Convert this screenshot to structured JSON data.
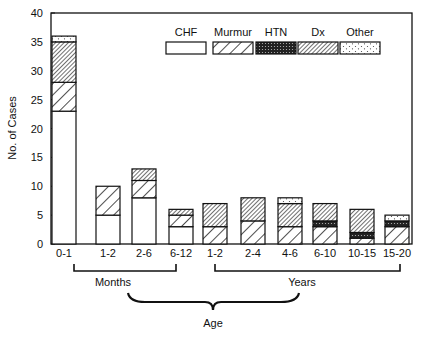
{
  "chart_data": {
    "type": "bar",
    "stacked": true,
    "title": "",
    "xlabel": "Age",
    "ylabel": "No. of Cases",
    "ylim": [
      0,
      40
    ],
    "yticks": [
      0,
      5,
      10,
      15,
      20,
      25,
      30,
      35,
      40
    ],
    "grid": false,
    "legend_position": "top-right inside",
    "categories": [
      "0-1",
      "1-2",
      "2-6",
      "6-12",
      "1-2",
      "2-4",
      "4-6",
      "6-10",
      "10-15",
      "15-20"
    ],
    "category_groups": [
      {
        "label": "Months",
        "from": 0,
        "to": 3
      },
      {
        "label": "Years",
        "from": 4,
        "to": 9
      }
    ],
    "series": [
      {
        "name": "CHF",
        "pattern": "open",
        "values": [
          23,
          5,
          8,
          3,
          0,
          0,
          0,
          0,
          0,
          0
        ]
      },
      {
        "name": "Murmur",
        "pattern": "wide-hatch",
        "values": [
          5,
          5,
          3,
          2,
          3,
          4,
          3,
          3,
          1,
          3
        ]
      },
      {
        "name": "HTN",
        "pattern": "dense-dots",
        "values": [
          0,
          0,
          0,
          0,
          0,
          0,
          0,
          1,
          1,
          1
        ]
      },
      {
        "name": "Dx",
        "pattern": "dense-hatch",
        "values": [
          7,
          0,
          2,
          1,
          4,
          4,
          4,
          3,
          4,
          0
        ]
      },
      {
        "name": "Other",
        "pattern": "sparse-dots",
        "values": [
          1,
          0,
          0,
          0,
          0,
          0,
          1,
          0,
          0,
          1
        ]
      }
    ]
  }
}
